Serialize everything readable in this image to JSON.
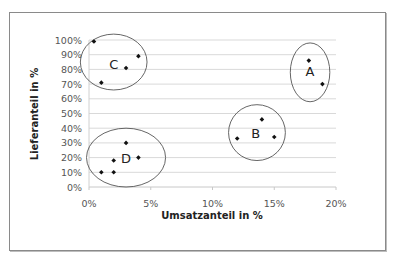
{
  "chart_data": {
    "type": "scatter",
    "title": "",
    "xlabel": "Umsatzanteil in %",
    "ylabel": "Lieferanteil in %",
    "xlim": [
      0,
      20
    ],
    "ylim": [
      0,
      100
    ],
    "x_ticks": [
      "0%",
      "5%",
      "10%",
      "15%",
      "20%"
    ],
    "y_ticks": [
      "0%",
      "10%",
      "20%",
      "30%",
      "40%",
      "50%",
      "60%",
      "70%",
      "80%",
      "90%",
      "100%"
    ],
    "grid": "horizontal",
    "legend": "none",
    "series": [
      {
        "name": "A",
        "points": [
          [
            17.8,
            86
          ],
          [
            18.9,
            70
          ]
        ]
      },
      {
        "name": "B",
        "points": [
          [
            14.0,
            46
          ],
          [
            12.0,
            33
          ],
          [
            15.0,
            34
          ]
        ]
      },
      {
        "name": "C",
        "points": [
          [
            0.4,
            99
          ],
          [
            1.0,
            71
          ],
          [
            3.0,
            81
          ],
          [
            4.0,
            89
          ]
        ]
      },
      {
        "name": "D",
        "points": [
          [
            1.0,
            10
          ],
          [
            2.0,
            10
          ],
          [
            2.0,
            18
          ],
          [
            3.0,
            30
          ],
          [
            4.0,
            20
          ]
        ]
      }
    ],
    "annotations": [
      {
        "label": "A",
        "shape": "ellipse",
        "cx": 17.9,
        "cy": 78,
        "rx_pct": 1.6,
        "ry_pct": 20
      },
      {
        "label": "B",
        "shape": "ellipse",
        "cx": 13.6,
        "cy": 37,
        "rx_pct": 2.3,
        "ry_pct": 19
      },
      {
        "label": "C",
        "shape": "ellipse",
        "cx": 2.0,
        "cy": 85,
        "rx_pct": 2.7,
        "ry_pct": 19
      },
      {
        "label": "D",
        "shape": "ellipse",
        "cx": 3.0,
        "cy": 20,
        "rx_pct": 3.2,
        "ry_pct": 20
      }
    ]
  }
}
